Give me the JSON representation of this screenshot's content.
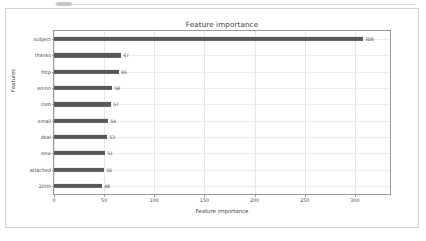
{
  "figure": {
    "title": "Feature importance",
    "xlabel": "Feature importance",
    "ylabel": "Features"
  },
  "chart_data": {
    "type": "bar",
    "orientation": "horizontal",
    "title": "Feature importance",
    "xlabel": "Feature importance",
    "ylabel": "Features",
    "categories": [
      "subject",
      "thanks",
      "http",
      "enron",
      "com",
      "email",
      "deal",
      "new",
      "attached",
      "2000"
    ],
    "values": [
      308,
      67,
      65,
      58,
      57,
      54,
      53,
      51,
      50,
      48
    ],
    "data_labels": [
      "308",
      "67",
      "65",
      "58",
      "57",
      "54",
      "53",
      "51",
      "50",
      "48"
    ],
    "xlim": [
      0,
      335
    ],
    "xticks": [
      0,
      50,
      100,
      150,
      200,
      250,
      300
    ],
    "xtick_labels": [
      "0",
      "50",
      "100",
      "150",
      "200",
      "250",
      "300"
    ],
    "grid": "x-axis vertical gridlines and per-category horizontal gridlines",
    "legend": null,
    "bar_color": "#585858"
  },
  "colors": {
    "bar": "#585858",
    "grid": "#e8e8e8",
    "axis": "#9a9a9a",
    "text": "#3f3f3f",
    "card_border": "#d2d2d2",
    "background": "#ffffff"
  }
}
